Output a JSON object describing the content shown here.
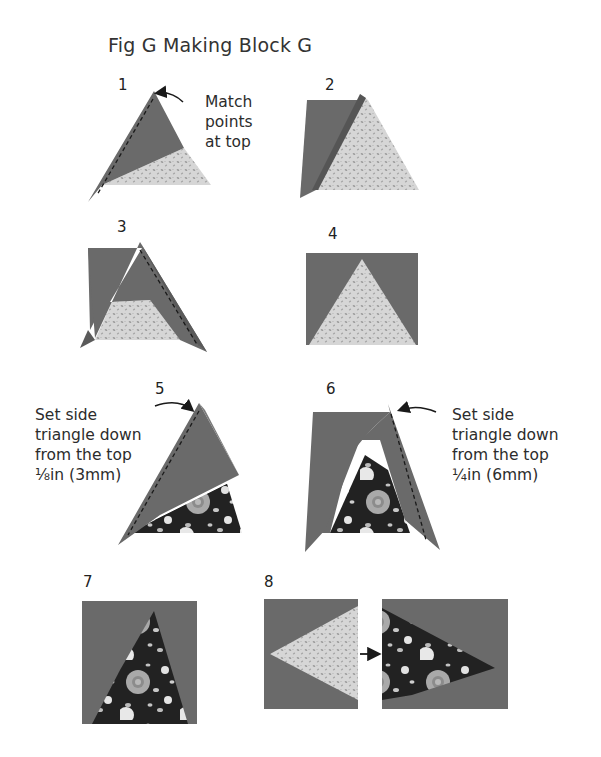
{
  "figure": {
    "title": "Fig G Making Block G",
    "colors": {
      "solid": "#6a6a6a",
      "light_print": "#d4d4d4",
      "light_print_dots": "#9a9a9a",
      "floral_dark": "#1e1e1e",
      "floral_flower": "#a8a8a8",
      "floral_white": "#e8e8e8",
      "seam_line": "#1a1a1a"
    },
    "steps": [
      {
        "number": "1",
        "note": [
          "Match",
          "points",
          "at top"
        ]
      },
      {
        "number": "2"
      },
      {
        "number": "3"
      },
      {
        "number": "4"
      },
      {
        "number": "5",
        "note": [
          "Set side",
          "triangle down",
          "from the top",
          "⅛in (3mm)"
        ]
      },
      {
        "number": "6",
        "note": [
          "Set side",
          "triangle down",
          "from the top",
          "¼in (6mm)"
        ]
      },
      {
        "number": "7"
      },
      {
        "number": "8"
      }
    ]
  }
}
